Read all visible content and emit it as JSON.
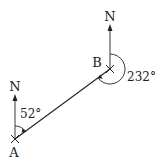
{
  "diagram": {
    "type": "bearing",
    "points": [
      {
        "id": "A",
        "label": "A"
      },
      {
        "id": "B",
        "label": "B"
      }
    ],
    "north_labels": {
      "at_A": "N",
      "at_B": "N"
    },
    "angles": {
      "bearing_A_to_B": "52°",
      "bearing_B_to_A": "232°"
    },
    "colors": {
      "ink": "#222222",
      "background": "#ffffff"
    }
  }
}
